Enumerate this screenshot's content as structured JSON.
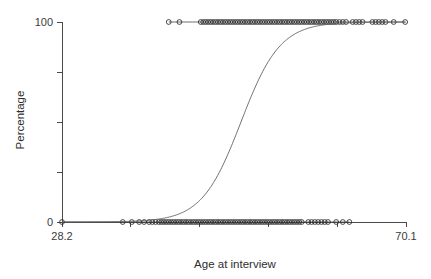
{
  "chart_data": {
    "type": "scatter",
    "title": "",
    "xlabel": "Age at interview",
    "ylabel": "Percentage",
    "xlim": [
      28.2,
      70.1
    ],
    "ylim": [
      0,
      100
    ],
    "grid": false,
    "legend": "none",
    "xticks": [
      28.2,
      36.58,
      44.96,
      53.34,
      61.72,
      70.1
    ],
    "xticklabels": [
      "28.2",
      "",
      "",
      "",
      "",
      "70.1"
    ],
    "yticks": [
      0,
      25,
      50,
      75,
      100
    ],
    "yticklabels": [
      "0",
      "",
      "",
      "",
      "100"
    ],
    "series": [
      {
        "name": "Fitted logistic curve",
        "type": "line",
        "description": "Logistic (sigmoid) fit of percentage against age at interview",
        "midpoint_x": 50.0,
        "slope": 0.42,
        "lower_asymptote": 0,
        "upper_asymptote": 100
      },
      {
        "name": "Observed responses (100%)",
        "type": "scatter",
        "y": 100,
        "x": [
          41.2,
          42.5,
          45.1,
          45.4,
          45.7,
          46.0,
          46.3,
          46.6,
          46.9,
          47.2,
          47.5,
          47.8,
          48.1,
          48.4,
          48.7,
          49.0,
          49.3,
          49.6,
          49.9,
          50.2,
          50.5,
          50.8,
          51.1,
          51.4,
          51.7,
          52.0,
          52.3,
          52.6,
          52.9,
          53.2,
          53.5,
          53.8,
          54.1,
          54.4,
          54.7,
          55.0,
          55.3,
          55.6,
          55.9,
          56.2,
          56.5,
          56.8,
          57.1,
          57.4,
          57.7,
          58.0,
          58.3,
          58.6,
          58.9,
          59.2,
          59.5,
          59.8,
          60.1,
          60.4,
          60.7,
          61.0,
          61.3,
          61.6,
          62.0,
          62.4,
          62.8,
          63.6,
          64.0,
          64.4,
          64.8,
          66.0,
          66.4,
          66.8,
          67.2,
          67.6,
          68.6,
          70.0
        ]
      },
      {
        "name": "Observed responses (0%)",
        "type": "scatter",
        "y": 0,
        "x": [
          28.2,
          35.6,
          36.7,
          37.6,
          38.2,
          38.8,
          39.2,
          39.6,
          40.0,
          40.3,
          40.6,
          40.9,
          41.2,
          41.5,
          41.8,
          42.1,
          42.4,
          42.7,
          43.0,
          43.3,
          43.6,
          43.9,
          44.2,
          44.5,
          44.8,
          45.1,
          45.4,
          45.7,
          46.0,
          46.3,
          46.6,
          46.9,
          47.2,
          47.5,
          47.8,
          48.1,
          48.4,
          48.7,
          49.0,
          49.3,
          49.6,
          49.9,
          50.2,
          50.5,
          50.8,
          51.1,
          51.4,
          51.7,
          52.0,
          52.3,
          52.6,
          52.9,
          53.2,
          53.5,
          53.8,
          54.1,
          54.4,
          54.7,
          55.0,
          55.3,
          55.6,
          55.9,
          56.2,
          56.5,
          56.8,
          57.1,
          57.4,
          58.2,
          58.6,
          59.0,
          59.4,
          59.8,
          60.2,
          60.6,
          61.6,
          62.4,
          63.2
        ]
      }
    ]
  }
}
